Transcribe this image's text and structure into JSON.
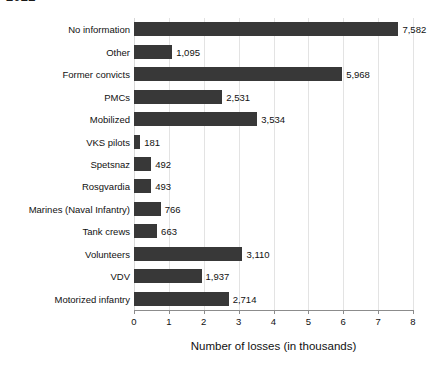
{
  "chart_data": {
    "type": "bar",
    "orientation": "horizontal",
    "title": "2022",
    "xlabel": "Number of losses (in thousands)",
    "ylabel": "",
    "xlim": [
      0,
      8
    ],
    "xticks": [
      0,
      1,
      2,
      3,
      4,
      5,
      6,
      7,
      8
    ],
    "xtick_labels": [
      "0",
      "1",
      "2",
      "3",
      "4",
      "5",
      "6",
      "7",
      "8"
    ],
    "grid": "vertical",
    "legend": "none",
    "bar_color": "#383838",
    "gridline_color": "#e3e3e3",
    "axis_color": "#8c8c8c",
    "value_unit": "losses",
    "categories": [
      "No information",
      "Other",
      "Former convicts",
      "PMCs",
      "Mobilized",
      "VKS pilots",
      "Spetsnaz",
      "Rosgvardia",
      "Marines (Naval Infantry)",
      "Tank crews",
      "Volunteers",
      "VDV",
      "Motorized infantry"
    ],
    "values": [
      7582,
      1095,
      5968,
      2531,
      3534,
      181,
      492,
      493,
      766,
      663,
      3110,
      1937,
      2714
    ],
    "value_labels": [
      "7,582",
      "1,095",
      "5,968",
      "2,531",
      "3,534",
      "181",
      "492",
      "493",
      "766",
      "663",
      "3,110",
      "1,937",
      "2,714"
    ]
  }
}
